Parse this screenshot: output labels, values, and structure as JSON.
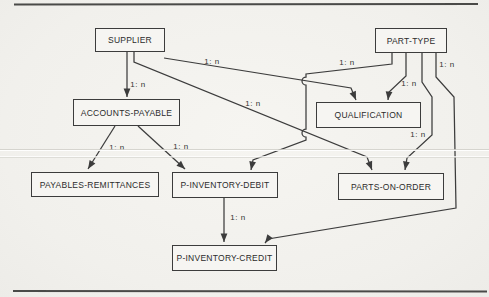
{
  "figure": {
    "type": "data-structure-diagram",
    "line_color": "#3c3c3c",
    "background_color": "#f3f2ee",
    "cardinality_label": "1: n",
    "rules": [
      {
        "name": "top-rule",
        "x1": 14,
        "y1": 4.5,
        "x2": 478,
        "y2": 4,
        "width": 1.8
      },
      {
        "name": "bottom-rule",
        "x1": 13,
        "y1": 291,
        "x2": 487,
        "y2": 291.5,
        "width": 2
      }
    ],
    "nodes": [
      {
        "id": "supplier",
        "label": "SUPPLIER",
        "x": 95,
        "y": 28,
        "w": 70,
        "h": 24
      },
      {
        "id": "part-type",
        "label": "PART-TYPE",
        "x": 375,
        "y": 28,
        "w": 72,
        "h": 25
      },
      {
        "id": "accounts-payable",
        "label": "ACCOUNTS-PAYABLE",
        "x": 73,
        "y": 99,
        "w": 107,
        "h": 27
      },
      {
        "id": "qualification",
        "label": "QUALIFICATION",
        "x": 316,
        "y": 102,
        "w": 105,
        "h": 26
      },
      {
        "id": "payables-remittances",
        "label": "PAYABLES-REMITTANCES",
        "x": 31,
        "y": 172,
        "w": 128,
        "h": 25
      },
      {
        "id": "p-inventory-debit",
        "label": "P-INVENTORY-DEBIT",
        "x": 172,
        "y": 172,
        "w": 106,
        "h": 26
      },
      {
        "id": "parts-on-order",
        "label": "PARTS-ON-ORDER",
        "x": 338,
        "y": 173,
        "w": 106,
        "h": 27
      },
      {
        "id": "p-inventory-credit",
        "label": "P-INVENTORY-CREDIT",
        "x": 172,
        "y": 245,
        "w": 105,
        "h": 26
      }
    ],
    "edges": [
      {
        "from": "supplier",
        "to": "accounts-payable",
        "label": "1: n",
        "label_x": 138,
        "label_y": 84,
        "points": [
          [
            127,
            52
          ],
          [
            127,
            97
          ]
        ]
      },
      {
        "from": "supplier",
        "to": "qualification",
        "label": "1: n",
        "label_x": 212,
        "label_y": 61,
        "points": [
          [
            164,
            58
          ],
          [
            351,
            88
          ],
          [
            356,
            100
          ]
        ]
      },
      {
        "from": "supplier",
        "to": "parts-on-order",
        "label": "1: n",
        "label_x": 253,
        "label_y": 103,
        "points": [
          [
            134,
            52
          ],
          [
            134,
            62
          ],
          [
            367,
            157
          ],
          [
            372,
            170
          ]
        ]
      },
      {
        "from": "part-type",
        "to": "p-inventory-debit",
        "label": "1: n",
        "label_x": 347,
        "label_y": 62,
        "points": [
          [
            392,
            53
          ],
          [
            392,
            64
          ],
          [
            306,
            74
          ],
          [
            306,
            140
          ],
          [
            253,
            160
          ],
          [
            251,
            170
          ]
        ],
        "hops": [
          [
            306,
            81
          ],
          [
            306,
            133
          ]
        ]
      },
      {
        "from": "part-type",
        "to": "qualification",
        "label": "1: n",
        "label_x": 409,
        "label_y": 83,
        "points": [
          [
            406,
            53
          ],
          [
            406,
            76
          ],
          [
            389,
            92
          ],
          [
            388,
            100
          ]
        ]
      },
      {
        "from": "part-type",
        "to": "parts-on-order",
        "label": "1: n",
        "label_x": 418,
        "label_y": 134,
        "points": [
          [
            422,
            53
          ],
          [
            422,
            82
          ],
          [
            432,
            97
          ],
          [
            432,
            135
          ],
          [
            407,
            158
          ],
          [
            405,
            170
          ]
        ]
      },
      {
        "from": "part-type",
        "to": "p-inventory-credit",
        "label": "1: n",
        "label_x": 447,
        "label_y": 64,
        "points": [
          [
            436,
            53
          ],
          [
            436,
            77
          ],
          [
            454,
            97
          ],
          [
            456,
            208
          ],
          [
            268,
            239
          ],
          [
            265,
            243
          ]
        ]
      },
      {
        "from": "accounts-payable",
        "to": "payables-remittances",
        "label": "1: n",
        "label_x": 117,
        "label_y": 147,
        "points": [
          [
            115,
            126
          ],
          [
            88,
            169
          ]
        ]
      },
      {
        "from": "accounts-payable",
        "to": "p-inventory-debit",
        "label": "1: n",
        "label_x": 181,
        "label_y": 146,
        "points": [
          [
            138,
            126
          ],
          [
            185,
            169
          ]
        ]
      },
      {
        "from": "p-inventory-debit",
        "to": "p-inventory-credit",
        "label": "1: n",
        "label_x": 238,
        "label_y": 217,
        "points": [
          [
            224,
            198
          ],
          [
            224,
            242
          ]
        ]
      }
    ]
  }
}
